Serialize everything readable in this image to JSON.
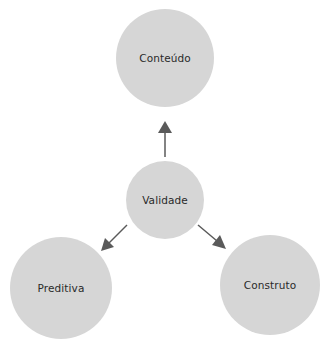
{
  "diagram": {
    "colors": {
      "node_fill": "#d6d6d6",
      "arrow": "#5a5a5a",
      "text": "#2a2a2a"
    },
    "nodes": [
      {
        "id": "conteudo",
        "label": "Conteúdo",
        "cx": 165,
        "cy": 58,
        "r": 49
      },
      {
        "id": "validade",
        "label": "Validade",
        "cx": 165,
        "cy": 200,
        "r": 39
      },
      {
        "id": "preditiva",
        "label": "Preditiva",
        "cx": 61,
        "cy": 288,
        "r": 51
      },
      {
        "id": "construto",
        "label": "Construto",
        "cx": 270,
        "cy": 285,
        "r": 50
      }
    ],
    "edges": [
      {
        "from": "validade",
        "to": "conteudo"
      },
      {
        "from": "validade",
        "to": "preditiva"
      },
      {
        "from": "validade",
        "to": "construto"
      }
    ]
  }
}
